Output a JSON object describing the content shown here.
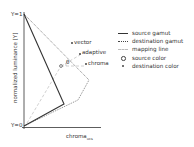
{
  "diagram": {
    "y_axis": {
      "label": "normalized luminance [Y]",
      "top_tick": "Y=1",
      "bottom_tick": "Y=0"
    },
    "x_axis": {
      "label": "chroma",
      "label_subscript": "ucs"
    },
    "annotations": {
      "vector": "vector",
      "adaptive": "adaptive",
      "chroma": "chroma",
      "theta": "θ"
    },
    "colors": {
      "source_gamut": "#333333",
      "destination_gamut": "#555555",
      "mapping_line": "#bbbbbb",
      "text": "#333333"
    }
  },
  "legend": {
    "items": [
      {
        "label": "source gamut",
        "style": "solid"
      },
      {
        "label": "destination gamut",
        "style": "dotted"
      },
      {
        "label": "mapping line",
        "style": "dashed"
      },
      {
        "label": "source color",
        "style": "circle"
      },
      {
        "label": "destination color",
        "style": "dot"
      }
    ]
  }
}
